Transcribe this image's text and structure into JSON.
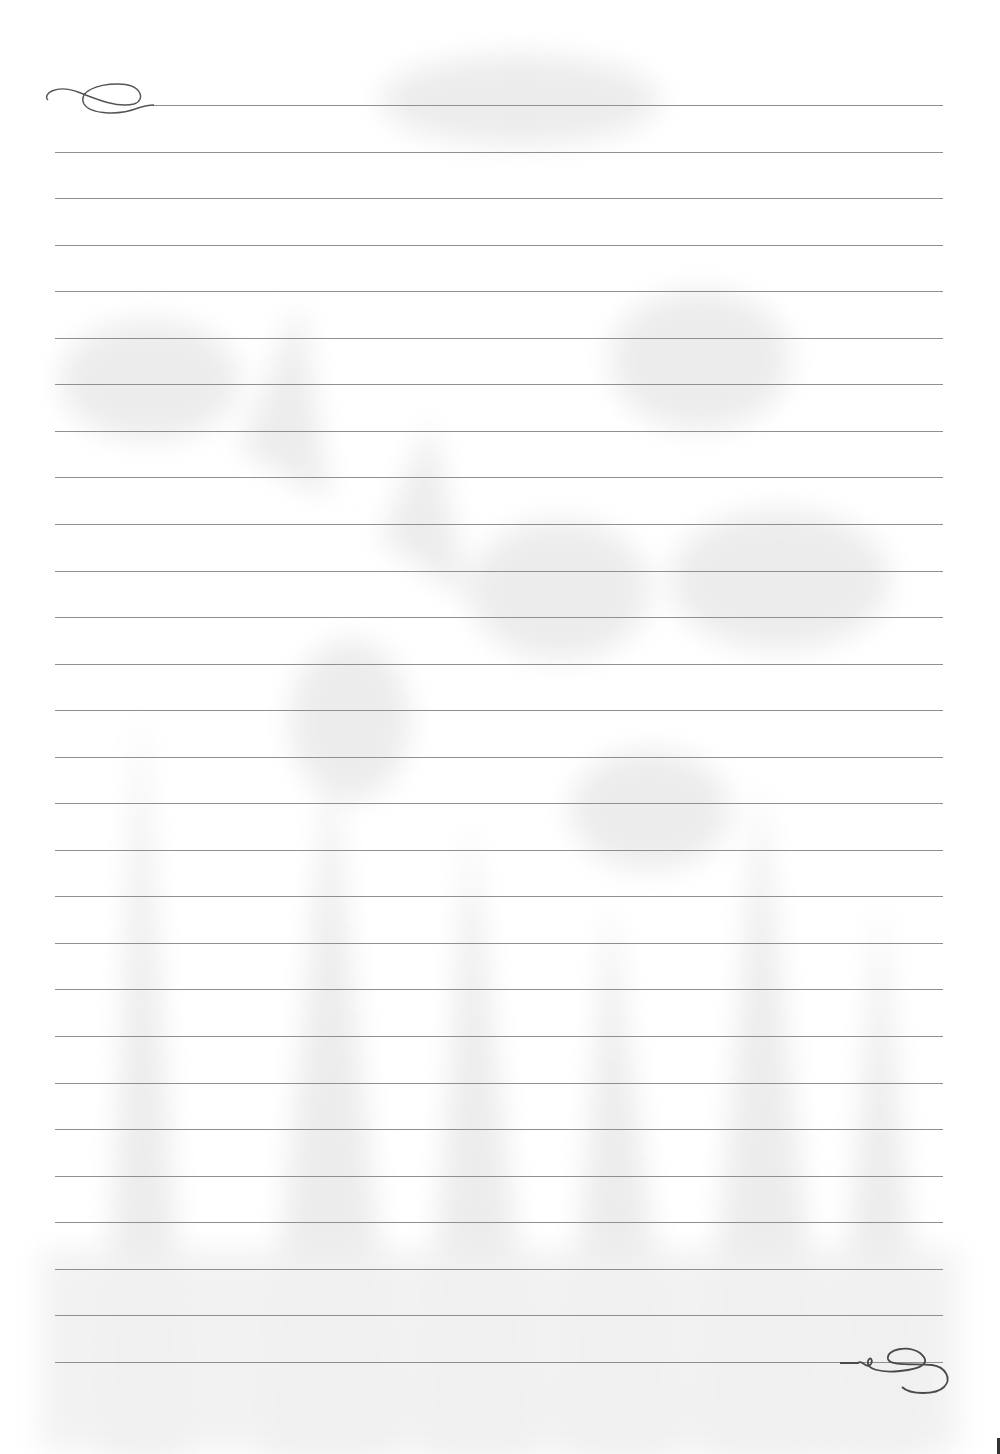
{
  "page": {
    "type": "lined-stationery",
    "background_color": "#ffffff",
    "watermark": "floral-lilies",
    "watermark_color": "#ececec",
    "rule_color": "#8f8f8f",
    "flourish_color": "#555555"
  },
  "rules": {
    "count": 28,
    "first_y": 105,
    "spacing": 46.55,
    "x_start": 55,
    "x_end": 943,
    "first_x_start": 150
  },
  "decorations": {
    "top_left": "calligraphic-flourish-icon",
    "bottom_right": "calligraphic-flourish-icon"
  }
}
